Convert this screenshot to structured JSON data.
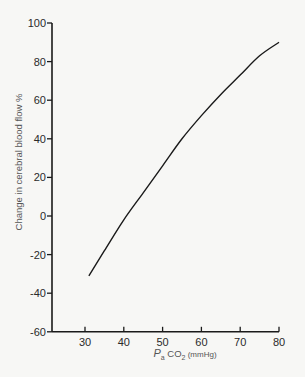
{
  "chart_data": {
    "type": "line",
    "title": "",
    "xlabel": "Pa CO2 (mmHg)",
    "xlabel_parts": {
      "main": "P",
      "sub1": "a",
      "mid": " CO",
      "sub2": "2",
      "unit": " (mmHg)"
    },
    "ylabel": "Change in cerebral blood flow %",
    "xlim": [
      25,
      80
    ],
    "ylim": [
      -60,
      100
    ],
    "xticks": [
      30,
      40,
      50,
      60,
      70,
      80
    ],
    "yticks": [
      100,
      80,
      60,
      40,
      20,
      0,
      -20,
      -40,
      -60
    ],
    "ytick_labels": [
      "100",
      "80",
      "60",
      "40",
      "20",
      "0",
      "-20",
      "-40",
      "-60"
    ],
    "grid": false,
    "series": [
      {
        "name": "CBF response",
        "x": [
          31,
          35,
          40,
          45,
          50,
          55,
          60,
          65,
          70,
          75,
          80
        ],
        "values": [
          -31,
          -18,
          -2,
          12,
          26,
          40,
          52,
          63,
          73,
          83,
          90
        ]
      }
    ],
    "line_color": "#1a1a1a"
  }
}
